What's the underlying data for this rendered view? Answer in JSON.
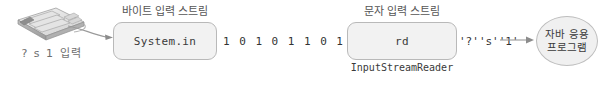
{
  "diagram": {
    "input_device": {
      "icon": "keyboard-icon",
      "caption": "?  s  1 입력"
    },
    "byte_stream": {
      "label": "바이트 입력 스트림",
      "box_text": "System.in",
      "bits": [
        "1",
        "0",
        "1",
        "0",
        "1",
        "1",
        "0",
        "1"
      ]
    },
    "char_stream": {
      "label": "문자 입력 스트림",
      "box_text": "rd",
      "box_caption": "InputStreamReader",
      "chars": [
        "'?'",
        "'s'",
        "'1'"
      ]
    },
    "application": {
      "line1": "자바 응용",
      "line2": "프로그램"
    },
    "colors": {
      "box_fill": "#f2f2f2",
      "box_border": "#b9b9b9",
      "oval_fill": "#f0f0f0",
      "oval_border": "#bdbdbd",
      "text": "#3a3a3a",
      "label_text": "#555555",
      "arrow": "#8c8c8c"
    }
  }
}
